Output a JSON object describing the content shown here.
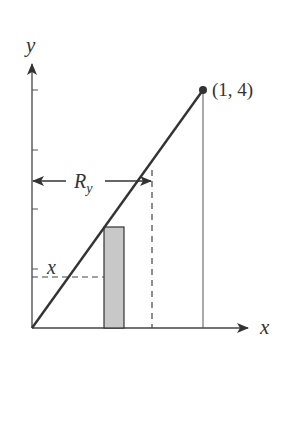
{
  "diagram": {
    "title": "",
    "axes": {
      "x_label": "x",
      "y_label": "y"
    },
    "point_label": "(1, 4)",
    "bracket_label_main": "R",
    "bracket_label_sub": "y",
    "level_label": "x",
    "colors": {
      "line": "#333333",
      "rect_fill": "#c8c8c8",
      "background": "#ffffff"
    }
  }
}
